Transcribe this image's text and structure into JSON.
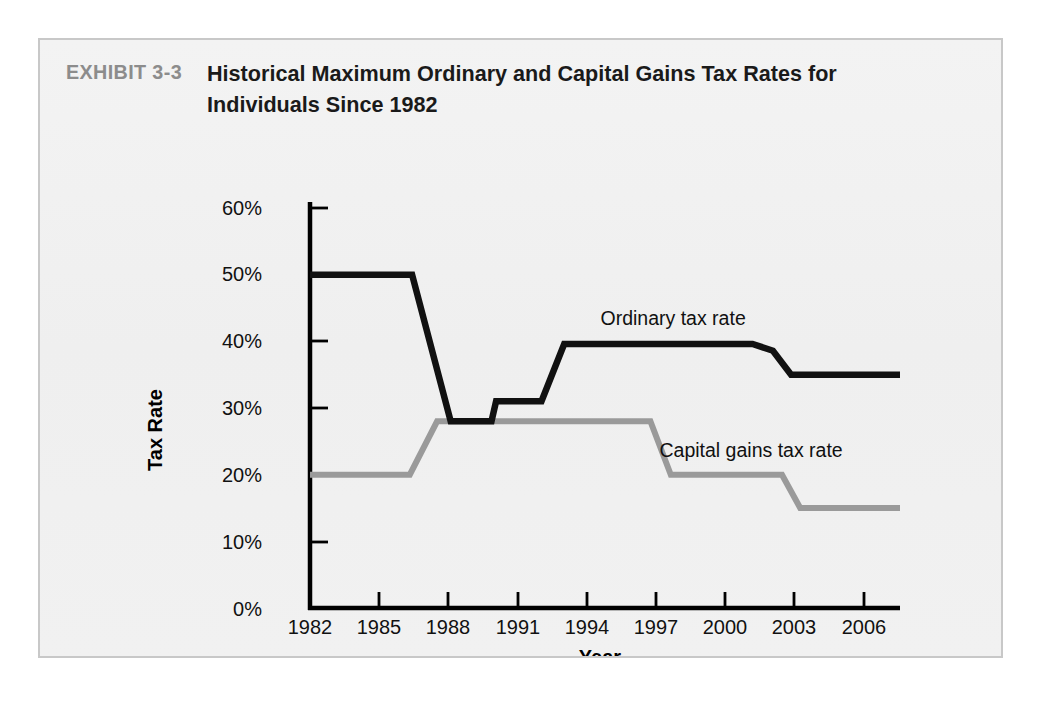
{
  "exhibit": {
    "tag": "EXHIBIT 3-3",
    "title": "Historical Maximum Ordinary and Capital Gains Tax Rates for Individuals Since 1982"
  },
  "colors": {
    "ordinary_line": "#111111",
    "capital_gains_line": "#9a9a9a",
    "axis": "#000000",
    "frame_border": "#c8c8c8",
    "panel_background": "#f1f1f1",
    "tag_text": "#8c8c8c"
  },
  "chart_data": {
    "type": "line",
    "title": "Historical Maximum Ordinary and Capital Gains Tax Rates for Individuals Since 1982",
    "xlabel": "Year",
    "ylabel": "Tax Rate",
    "xlim": [
      1982,
      2008
    ],
    "ylim": [
      0,
      60
    ],
    "grid": false,
    "legend": "inline-annotations",
    "x_ticks": [
      1982,
      1985,
      1988,
      1991,
      1994,
      1997,
      2000,
      2003,
      2006
    ],
    "x_tick_labels": [
      "1982",
      "1985",
      "1988",
      "1991",
      "1994",
      "1997",
      "2000",
      "2003",
      "2006"
    ],
    "y_ticks": [
      0,
      10,
      20,
      30,
      40,
      50,
      60
    ],
    "y_tick_labels": [
      "0%",
      "10%",
      "20%",
      "30%",
      "40%",
      "50%",
      "60%"
    ],
    "series": [
      {
        "name": "Ordinary tax rate",
        "color": "#111111",
        "label_text": "Ordinary tax rate",
        "x": [
          1982,
          1986.5,
          1988.2,
          1990.0,
          1990.2,
          1992.2,
          1993.2,
          2001.5,
          2002.4,
          2003.2,
          2008
        ],
        "values": [
          50,
          50,
          28,
          28,
          31,
          31,
          39.6,
          39.6,
          38.6,
          35,
          35
        ]
      },
      {
        "name": "Capital gains tax rate",
        "color": "#9a9a9a",
        "label_text": "Capital gains tax rate",
        "x": [
          1982,
          1986.4,
          1987.6,
          1997.0,
          1997.9,
          2002.8,
          2003.6,
          2008
        ],
        "values": [
          20,
          20,
          28,
          28,
          20,
          20,
          15,
          15
        ]
      }
    ],
    "annotations": [
      {
        "text": "Ordinary tax rate",
        "x": 1994.8,
        "y": 42.5
      },
      {
        "text": "Capital gains tax rate",
        "x": 1997.4,
        "y": 22.6
      }
    ]
  },
  "axes": {
    "y_axis_title": "Tax Rate",
    "x_axis_title": "Year"
  }
}
